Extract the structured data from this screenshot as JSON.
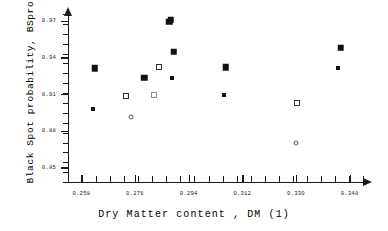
{
  "chart_data": {
    "type": "scatter",
    "title": "",
    "xlabel": "Dry Matter content ,  DM   (1)",
    "ylabel": "Black Spot probability, BSprob",
    "xlim": [
      0.2535,
      0.3525
    ],
    "ylim": [
      0.838,
      0.9755
    ],
    "grid": false,
    "legend": "none",
    "xticks": [
      0.258,
      0.276,
      0.294,
      0.312,
      0.33,
      0.348
    ],
    "xtick_labels": [
      "0.258",
      "0.276",
      "0.294",
      "0.312",
      "0.330",
      "0.348"
    ],
    "yticks": [
      0.85,
      0.88,
      0.91,
      0.94,
      0.97
    ],
    "ytick_labels": [
      "0.85",
      "0.88",
      "0.91",
      "0.94",
      "0.97"
    ],
    "xminor_count": 21,
    "yminor_count": 17,
    "series": [
      {
        "name": "filled-large",
        "marker": "filled-square-large",
        "color": "#111111",
        "points": [
          {
            "x": 0.2625,
            "y": 0.931
          },
          {
            "x": 0.279,
            "y": 0.9232
          },
          {
            "x": 0.2875,
            "y": 0.969
          },
          {
            "x": 0.288,
            "y": 0.971
          },
          {
            "x": 0.289,
            "y": 0.9445
          },
          {
            "x": 0.3065,
            "y": 0.932
          },
          {
            "x": 0.345,
            "y": 0.948
          }
        ]
      },
      {
        "name": "filled-small",
        "marker": "filled-square-small",
        "color": "#111111",
        "points": [
          {
            "x": 0.262,
            "y": 0.8975
          },
          {
            "x": 0.2885,
            "y": 0.923
          },
          {
            "x": 0.306,
            "y": 0.9095
          },
          {
            "x": 0.344,
            "y": 0.931
          }
        ]
      },
      {
        "name": "open-square",
        "marker": "open-square",
        "color": "#333333",
        "points": [
          {
            "x": 0.273,
            "y": 0.9085
          },
          {
            "x": 0.284,
            "y": 0.9325
          },
          {
            "x": 0.2825,
            "y": 0.909
          },
          {
            "x": 0.3305,
            "y": 0.9025
          }
        ]
      },
      {
        "name": "open-circle",
        "marker": "open-circle",
        "color": "#555555",
        "points": [
          {
            "x": 0.2745,
            "y": 0.891
          },
          {
            "x": 0.33,
            "y": 0.87
          }
        ]
      }
    ]
  }
}
